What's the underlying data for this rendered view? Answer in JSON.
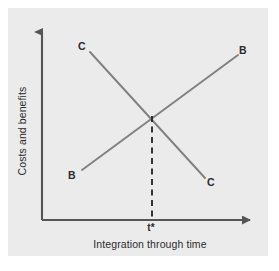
{
  "figure": {
    "name": "costs-and-benefits-vs-integration-diagram",
    "background_color": "#ffffff",
    "panel_color": "#ebebeb"
  },
  "axes": {
    "y_label": "Costs and benefits",
    "x_label": "Integration through time",
    "axis_color": "#555555",
    "origin": {
      "x": 42,
      "y": 220
    },
    "y_arrow_tip": {
      "x": 42,
      "y": 24
    },
    "x_arrow_tip": {
      "x": 258,
      "y": 220
    }
  },
  "markers": {
    "t_star": "t*",
    "t_star_x": 152
  },
  "curves": [
    {
      "id": "costs-curve",
      "start_label": "C",
      "end_label": "C",
      "description": "Costs decline through integration time",
      "color": "#808080",
      "start": {
        "x": 90,
        "y": 52
      },
      "end": {
        "x": 205,
        "y": 178
      }
    },
    {
      "id": "benefits-curve",
      "start_label": "B",
      "end_label": "B",
      "description": "Benefits rise through integration time",
      "color": "#808080",
      "start": {
        "x": 82,
        "y": 170
      },
      "end": {
        "x": 238,
        "y": 55
      }
    }
  ],
  "intersection": {
    "x": 152,
    "y": 116,
    "dashed_line_color": "#2b2b2b"
  },
  "labels": {
    "c_top": "C",
    "b_top": "B",
    "b_bottom": "B",
    "c_bottom": "C"
  }
}
